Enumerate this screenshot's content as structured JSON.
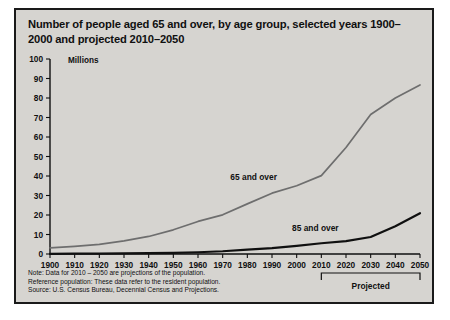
{
  "figure": {
    "title": "Number of people aged 65 and over, by age group, selected years 1900–2000 and projected 2010–2050",
    "background_color": "#d6d4d0",
    "border_color": "#1a1a1a"
  },
  "footnotes": {
    "note": "Note: Data for 2010 – 2050 are projections of the population.",
    "reference": "Reference population: These data refer to the resident population.",
    "source": "Source: U.S. Census Bureau, Decennial Census and Projections."
  },
  "annotations": {
    "projected_label": "Projected",
    "projected_range": [
      2010,
      2050
    ]
  },
  "chart_data": {
    "type": "line",
    "title": "Number of people aged 65 and over, by age group, selected years 1900–2000 and projected 2010–2050",
    "xlabel": "",
    "ylabel": "Millions",
    "x": [
      1900,
      1910,
      1920,
      1930,
      1940,
      1950,
      1960,
      1970,
      1980,
      1990,
      2000,
      2010,
      2020,
      2030,
      2040,
      2050
    ],
    "xlim": [
      1900,
      2050
    ],
    "ylim": [
      0,
      100
    ],
    "xticks": [
      1900,
      1910,
      1920,
      1930,
      1940,
      1950,
      1960,
      1970,
      1980,
      1990,
      2000,
      2010,
      2020,
      2030,
      2040,
      2050
    ],
    "yticks": [
      0,
      10,
      20,
      30,
      40,
      50,
      60,
      70,
      80,
      90,
      100
    ],
    "grid": false,
    "legend_position": "inline-labels",
    "series": [
      {
        "name": "65 and over",
        "label": "65 and over",
        "color": "#6e6e6e",
        "line_width": 1.7,
        "values": [
          3.1,
          3.9,
          4.9,
          6.7,
          9.0,
          12.4,
          16.7,
          20.1,
          25.7,
          31.2,
          35.0,
          40.2,
          54.6,
          71.5,
          80.0,
          86.7
        ]
      },
      {
        "name": "85 and over",
        "label": "85 and over",
        "color": "#101010",
        "line_width": 2.2,
        "values": [
          0.1,
          0.2,
          0.2,
          0.3,
          0.4,
          0.6,
          0.9,
          1.4,
          2.2,
          3.0,
          4.2,
          5.5,
          6.6,
          8.7,
          14.2,
          20.9
        ]
      }
    ],
    "annotations": [
      {
        "text": "65 and over",
        "x": 1992,
        "y": 38
      },
      {
        "text": "85 and over",
        "x": 2017,
        "y": 12
      }
    ]
  }
}
